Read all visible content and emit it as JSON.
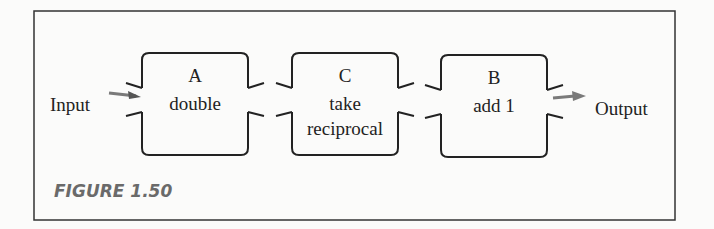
{
  "figure": {
    "caption": "FIGURE 1.50",
    "input_label": "Input",
    "output_label": "Output",
    "arrow_color": "#7a7a7a",
    "boxes": [
      {
        "letter": "A",
        "line1": "double",
        "line2": ""
      },
      {
        "letter": "C",
        "line1": "take",
        "line2": "reciprocal"
      },
      {
        "letter": "B",
        "line1": "add 1",
        "line2": ""
      }
    ]
  }
}
